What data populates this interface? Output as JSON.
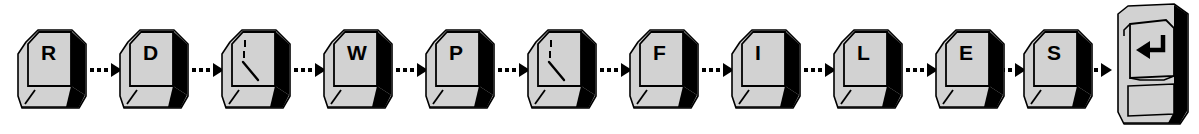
{
  "diagram": {
    "typed_sequence": "RD?WP?FILES",
    "colors": {
      "background": "#ffffff",
      "keycap_top": "#d2d2d2",
      "keycap_front": "#d2d2d2",
      "keycap_side_shadow": "#000000",
      "outline": "#000000",
      "label_text": "#000000",
      "arrow": "#000000"
    },
    "keys": [
      {
        "id": "key-1",
        "label": "R",
        "glyph_type": "letter",
        "x": 14
      },
      {
        "id": "key-2",
        "label": "D",
        "glyph_type": "letter",
        "x": 116
      },
      {
        "id": "key-3",
        "label": "?",
        "glyph_type": "wildcard",
        "x": 218
      },
      {
        "id": "key-4",
        "label": "W",
        "glyph_type": "letter",
        "x": 320
      },
      {
        "id": "key-5",
        "label": "P",
        "glyph_type": "letter",
        "x": 422
      },
      {
        "id": "key-6",
        "label": "?",
        "glyph_type": "wildcard",
        "x": 524
      },
      {
        "id": "key-7",
        "label": "F",
        "glyph_type": "letter",
        "x": 626
      },
      {
        "id": "key-8",
        "label": "I",
        "glyph_type": "letter",
        "x": 728
      },
      {
        "id": "key-9",
        "label": "L",
        "glyph_type": "letter",
        "x": 830
      },
      {
        "id": "key-10",
        "label": "E",
        "glyph_type": "letter",
        "x": 932
      },
      {
        "id": "key-11",
        "label": "S",
        "glyph_type": "letter",
        "x": 1020
      }
    ],
    "enter_key": {
      "id": "key-enter",
      "label": "Enter",
      "glyph_type": "enter-arrow",
      "x": 1108
    },
    "arrows": [
      {
        "id": "arrow-1",
        "x": 88
      },
      {
        "id": "arrow-2",
        "x": 190
      },
      {
        "id": "arrow-3",
        "x": 292
      },
      {
        "id": "arrow-4",
        "x": 394
      },
      {
        "id": "arrow-5",
        "x": 496
      },
      {
        "id": "arrow-6",
        "x": 598
      },
      {
        "id": "arrow-7",
        "x": 700
      },
      {
        "id": "arrow-8",
        "x": 802
      },
      {
        "id": "arrow-9",
        "x": 904
      },
      {
        "id": "arrow-10",
        "x": 992
      },
      {
        "id": "arrow-11",
        "x": 1078
      }
    ]
  }
}
